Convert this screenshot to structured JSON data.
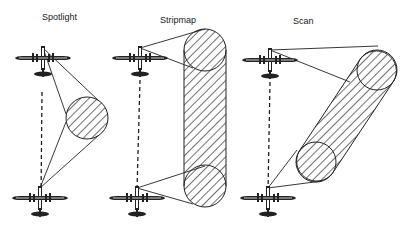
{
  "diagram": {
    "ink_color": "#222222",
    "background": "#ffffff",
    "panels": [
      {
        "id": "spotlight",
        "label": "Spotlight",
        "label_pos": [
          42,
          12
        ],
        "aircraft": [
          {
            "x": 43,
            "y": 62
          },
          {
            "x": 40,
            "y": 202
          }
        ],
        "footprint": {
          "type": "circle",
          "cx": 87,
          "cy": 118,
          "r": 21
        }
      },
      {
        "id": "stripmap",
        "label": "Stripmap",
        "label_pos": [
          160,
          15
        ],
        "aircraft": [
          {
            "x": 140,
            "y": 65
          },
          {
            "x": 137,
            "y": 206
          }
        ],
        "footprint": {
          "type": "strip",
          "x1": 184,
          "x2": 226,
          "top": 29,
          "bottom": 207,
          "r": 21
        }
      },
      {
        "id": "scan",
        "label": "Scan",
        "label_pos": [
          293,
          16
        ],
        "aircraft": [
          {
            "x": 270,
            "y": 66
          },
          {
            "x": 268,
            "y": 208
          }
        ],
        "footprint": {
          "type": "slanted-strip",
          "c1": [
            377,
            70
          ],
          "c2": [
            316,
            162
          ],
          "r": 20
        }
      }
    ]
  }
}
